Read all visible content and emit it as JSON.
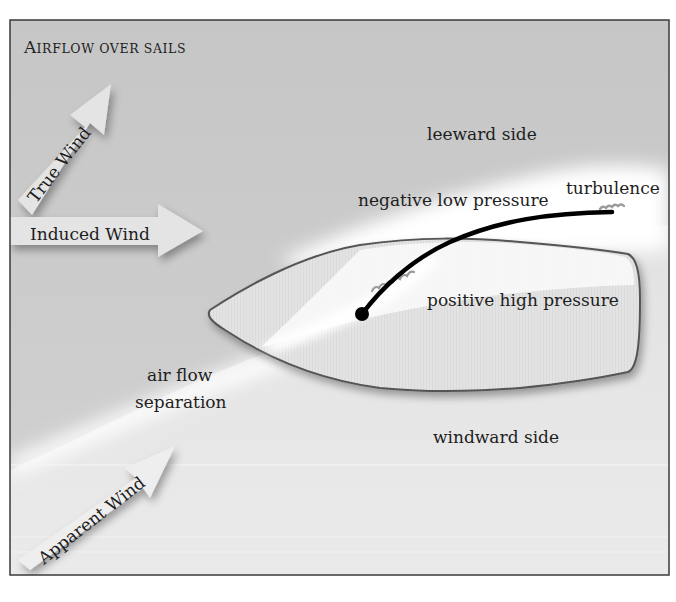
{
  "title": {
    "first_letter": "A",
    "rest": "IRFLOW OVER SAILS",
    "full": "Airflow over sails"
  },
  "arrows": {
    "true_wind": "True Wind",
    "induced_wind": "Induced Wind",
    "apparent_wind": "Apparent Wind"
  },
  "labels": {
    "leeward": "leeward side",
    "negative_pressure": "negative low pressure",
    "turbulence": "turbulence",
    "positive_pressure": "positive high pressure",
    "separation_line1": "air flow",
    "separation_line2": "separation",
    "windward": "windward side"
  },
  "colors": {
    "frame": "#3a3a3a",
    "leeward_bg": "#c9c9c9",
    "windward_bg": "#e6e6e6",
    "airflow_band": "#ffffff",
    "sail_fill": "#e2e2e2",
    "sail_outline": "#555555",
    "flow_line": "#000000",
    "turbulence": "#9a9a9a"
  }
}
